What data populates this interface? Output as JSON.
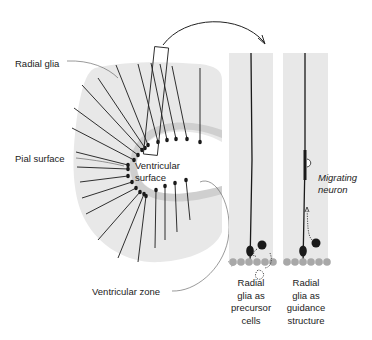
{
  "labels": {
    "radial_glia": "Radial glia",
    "pial_surface": "Pial surface",
    "ventricular_surface_line1": "Ventricular",
    "ventricular_surface_line2": "surface",
    "ventricular_zone": "Ventricular zone",
    "migrating_neuron_line1": "Migrating",
    "migrating_neuron_line2": "neuron"
  },
  "panels": [
    {
      "caption_lines": [
        "Radial",
        "glia as",
        "precursor",
        "cells"
      ]
    },
    {
      "caption_lines": [
        "Radial",
        "glia as",
        "guidance",
        "structure"
      ]
    }
  ],
  "colors": {
    "tissue": "#e8e8e8",
    "fiber": "#1a1a1a",
    "ventricular_cells": "#a8a8a8",
    "background": "#ffffff"
  }
}
